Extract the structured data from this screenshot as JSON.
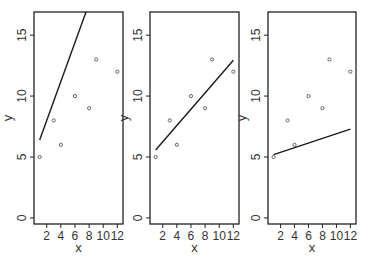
{
  "chart_data": [
    {
      "type": "scatter",
      "title": "",
      "xlabel": "x",
      "ylabel": "y",
      "xlim": [
        0.2,
        12.8
      ],
      "ylim": [
        -0.5,
        16.9
      ],
      "xticks": [
        2,
        4,
        6,
        8,
        10,
        12
      ],
      "yticks": [
        0,
        5,
        10,
        15
      ],
      "points": [
        {
          "x": 1,
          "y": 5
        },
        {
          "x": 3,
          "y": 8
        },
        {
          "x": 4,
          "y": 6
        },
        {
          "x": 6,
          "y": 10
        },
        {
          "x": 8,
          "y": 9
        },
        {
          "x": 9,
          "y": 13
        },
        {
          "x": 12,
          "y": 12
        }
      ],
      "line": {
        "intercept": 4.8,
        "slope": 1.6,
        "x_from": 1,
        "x_to": 12
      },
      "grid": false,
      "legend": null
    },
    {
      "type": "scatter",
      "title": "",
      "xlabel": "x",
      "ylabel": "y",
      "xlim": [
        0.2,
        12.8
      ],
      "ylim": [
        -0.5,
        16.9
      ],
      "xticks": [
        2,
        4,
        6,
        8,
        10,
        12
      ],
      "yticks": [
        0,
        5,
        10,
        15
      ],
      "points": [
        {
          "x": 1,
          "y": 5
        },
        {
          "x": 3,
          "y": 8
        },
        {
          "x": 4,
          "y": 6
        },
        {
          "x": 6,
          "y": 10
        },
        {
          "x": 8,
          "y": 9
        },
        {
          "x": 9,
          "y": 13
        },
        {
          "x": 12,
          "y": 12
        }
      ],
      "line": {
        "intercept": 4.9,
        "slope": 0.67,
        "x_from": 1,
        "x_to": 12
      },
      "grid": false,
      "legend": null
    },
    {
      "type": "scatter",
      "title": "",
      "xlabel": "x",
      "ylabel": "y",
      "xlim": [
        0.2,
        12.8
      ],
      "ylim": [
        -0.5,
        16.9
      ],
      "xticks": [
        2,
        4,
        6,
        8,
        10,
        12
      ],
      "yticks": [
        0,
        5,
        10,
        15
      ],
      "points": [
        {
          "x": 1,
          "y": 5
        },
        {
          "x": 3,
          "y": 8
        },
        {
          "x": 4,
          "y": 6
        },
        {
          "x": 6,
          "y": 10
        },
        {
          "x": 8,
          "y": 9
        },
        {
          "x": 9,
          "y": 13
        },
        {
          "x": 12,
          "y": 12
        }
      ],
      "line": {
        "intercept": 5.0,
        "slope": 0.19,
        "x_from": 1,
        "x_to": 12
      },
      "grid": false,
      "legend": null
    }
  ],
  "layout": {
    "panels": [
      {
        "left": 34,
        "right": 123,
        "top": 12,
        "bottom": 224
      },
      {
        "left": 150,
        "right": 239,
        "top": 12,
        "bottom": 224
      },
      {
        "left": 268,
        "right": 356,
        "top": 12,
        "bottom": 224
      }
    ]
  },
  "colors": {
    "frame": "#222222",
    "line": "#1a1a1a",
    "point": "#555555",
    "background": "#ffffff"
  }
}
